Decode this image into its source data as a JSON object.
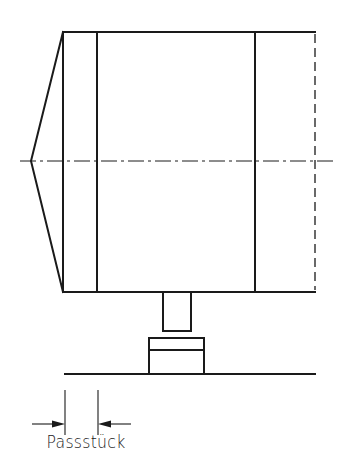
{
  "diagram": {
    "type": "technical-drawing",
    "labels": {
      "fitting_piece": "Passstück"
    },
    "colors": {
      "line": "#1a1a1a",
      "background": "#ffffff"
    },
    "elements": [
      "conical-end-cap",
      "housing-body",
      "inner-flange-line-left",
      "inner-flange-line-right",
      "hidden-edge-right",
      "center-line",
      "shaft",
      "support-block",
      "ground-line",
      "dimension-extension-lines",
      "dimension-arrows"
    ]
  }
}
